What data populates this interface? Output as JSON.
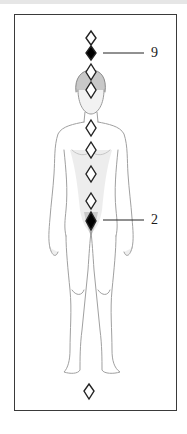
{
  "diagram": {
    "type": "chakra-diagram",
    "colors": {
      "frame": "#3a3a3a",
      "diamond_outline": "#222222",
      "diamond_highlight": "#000000",
      "label_line": "#222222",
      "sketch": "#9a9a9a",
      "top_strip": "#e6e6e6"
    },
    "markers": [
      {
        "index": 1,
        "y": 38,
        "filled": false
      },
      {
        "index": 2,
        "y": 53,
        "filled": true,
        "label": "9"
      },
      {
        "index": 3,
        "y": 72,
        "filled": false
      },
      {
        "index": 4,
        "y": 90,
        "filled": false
      },
      {
        "index": 5,
        "y": 128,
        "filled": false
      },
      {
        "index": 6,
        "y": 150,
        "filled": false
      },
      {
        "index": 7,
        "y": 174,
        "filled": false
      },
      {
        "index": 8,
        "y": 201,
        "filled": false
      },
      {
        "index": 9,
        "y": 221,
        "filled": true,
        "label": "2"
      },
      {
        "index": 10,
        "y": 391,
        "filled": false
      }
    ],
    "labels": {
      "upper": "9",
      "lower": "2"
    }
  }
}
